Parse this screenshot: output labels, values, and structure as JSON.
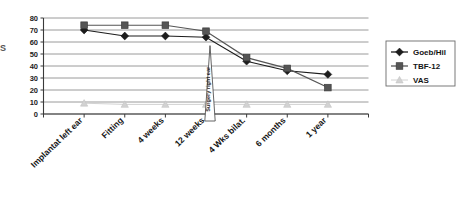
{
  "chart_data": {
    "type": "line",
    "title": "",
    "xlabel": "",
    "ylabel": "",
    "ylim": [
      0,
      80
    ],
    "ytick_step": 10,
    "yticks": [
      "0",
      "10",
      "20",
      "30",
      "40",
      "50",
      "60",
      "70",
      "80"
    ],
    "grid": true,
    "legend_position": "right",
    "categories": [
      "Implantat left ear",
      "Fitting",
      "4 weeks",
      "12 weeks",
      "4 Wks bilat.",
      "6 months",
      "1 year"
    ],
    "series": [
      {
        "name": "Goeb/Hil",
        "marker": "diamond",
        "color": "#1c1c1c",
        "values": [
          70,
          65,
          65,
          64,
          44,
          36,
          33
        ]
      },
      {
        "name": "TBF-12",
        "marker": "square",
        "color": "#555555",
        "values": [
          74,
          74,
          74,
          69,
          47,
          38,
          22
        ]
      },
      {
        "name": "VAS",
        "marker": "triangle",
        "color": "#d2d2d2",
        "values": [
          9,
          8,
          8,
          8,
          8,
          8,
          8
        ]
      }
    ],
    "annotations": [
      {
        "text": "Surgery right ear",
        "at_category": "12 weeks",
        "orientation": "vertical"
      }
    ]
  },
  "axis_title_fragment": "S",
  "legend": {
    "items": [
      {
        "label": "Goeb/Hil"
      },
      {
        "label": "TBF-12"
      },
      {
        "label": "VAS"
      }
    ]
  }
}
